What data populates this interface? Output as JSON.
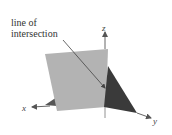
{
  "annotation": {
    "line1": "line of",
    "line2": "intersection"
  },
  "axes": {
    "x": "x",
    "y": "y",
    "z": "z"
  },
  "colors": {
    "plane_light": "#b3b3b3",
    "plane_dark": "#3a3a3a",
    "axis": "#555555",
    "text": "#333333",
    "background": "#ffffff"
  }
}
